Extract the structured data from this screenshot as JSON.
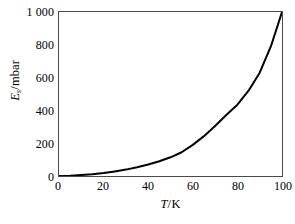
{
  "chart_data": {
    "type": "line",
    "title": "",
    "subtitle": "",
    "xlabel": "T / K",
    "ylabel": "E_s / mbar",
    "xlabel_symbol": "T",
    "xlabel_unit": "K",
    "ylabel_symbol": "E",
    "ylabel_subscript": "s",
    "ylabel_unit": "mbar",
    "separator": "/",
    "xlim": [
      0,
      100
    ],
    "ylim": [
      0,
      1000
    ],
    "xticks": [
      0,
      20,
      40,
      60,
      80,
      100
    ],
    "yticks": [
      0,
      200,
      400,
      600,
      800,
      1000
    ],
    "xtick_labels": [
      "0",
      "20",
      "40",
      "60",
      "80",
      "100"
    ],
    "ytick_labels": [
      "0",
      "200",
      "400",
      "600",
      "800",
      "1 000"
    ],
    "grid": false,
    "legend": false,
    "legend_position": "none",
    "series": [
      {
        "name": "saturation vapour pressure",
        "color": "#000000",
        "linewidth": 2,
        "x": [
          0,
          5,
          10,
          15,
          20,
          25,
          30,
          35,
          40,
          45,
          50,
          55,
          60,
          65,
          70,
          75,
          80,
          85,
          90,
          95,
          100
        ],
        "y": [
          0,
          2,
          6,
          11,
          18,
          28,
          39,
          53,
          70,
          90,
          114,
          145,
          190,
          243,
          305,
          372,
          435,
          520,
          630,
          790,
          1000
        ]
      }
    ],
    "annotations": []
  },
  "axes": {
    "y_ticks": [
      {
        "label": "1 000",
        "value": 1000
      },
      {
        "label": "800",
        "value": 800
      },
      {
        "label": "600",
        "value": 600
      },
      {
        "label": "400",
        "value": 400
      },
      {
        "label": "200",
        "value": 200
      },
      {
        "label": "0",
        "value": 0
      }
    ],
    "x_ticks": [
      {
        "label": "0",
        "value": 0
      },
      {
        "label": "20",
        "value": 20
      },
      {
        "label": "40",
        "value": 40
      },
      {
        "label": "60",
        "value": 60
      },
      {
        "label": "80",
        "value": 80
      },
      {
        "label": "100",
        "value": 100
      }
    ]
  },
  "style": {
    "background": "#ffffff",
    "frame_color": "#4a4a4a",
    "curve_color": "#000000",
    "tick_color": "#000000",
    "text_color": "#000000"
  }
}
